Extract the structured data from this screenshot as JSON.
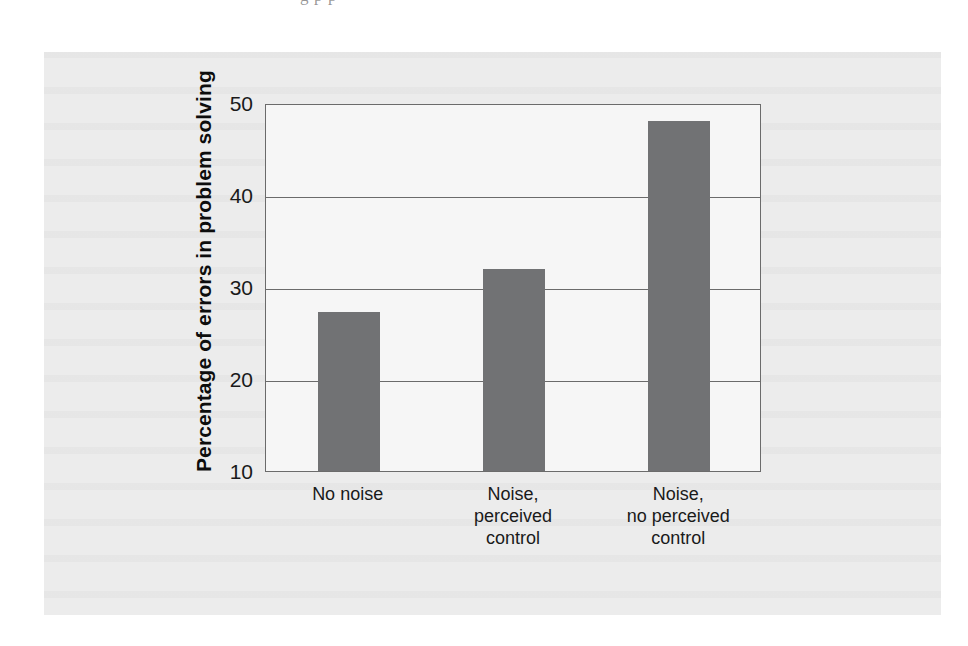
{
  "page": {
    "bleed_text_above_figure": "g                                      p   p"
  },
  "figure": {
    "panel_bg": "#ececec",
    "plot_bg": "#f6f6f6",
    "axis_color": "#6b6b6b",
    "bar_color": "#717274"
  },
  "chart_data": {
    "type": "bar",
    "title": "",
    "xlabel": "",
    "ylabel": "Percentage of errors in problem solving",
    "categories": [
      "No noise",
      "Noise,\nperceived\ncontrol",
      "Noise,\nno perceived\ncontrol"
    ],
    "category_labels_flat": [
      "No noise",
      "Noise, perceived control",
      "Noise, no perceived control"
    ],
    "values": [
      27.3,
      32.0,
      48.0
    ],
    "ylim": [
      10,
      50
    ],
    "yticks": [
      10,
      20,
      30,
      40,
      50
    ],
    "ytick_labels": [
      "10",
      "20",
      "30",
      "40",
      "50"
    ],
    "grid": true,
    "grid_axis": "y",
    "legend": null,
    "series": [
      {
        "name": "Percentage of errors in problem solving",
        "values": [
          27.3,
          32.0,
          48.0
        ],
        "color": "#717274"
      }
    ],
    "bar_color": "#717274",
    "annotations": []
  }
}
